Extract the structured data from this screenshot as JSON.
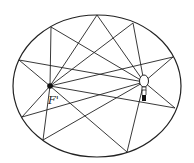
{
  "diagram": {
    "title": "",
    "type": "ellipse-reflection",
    "labels": {
      "focus": "F'"
    },
    "colors": {
      "stroke": "#222222",
      "background": "#ffffff"
    },
    "ellipse": {
      "cx": 97,
      "cy": 86,
      "rx": 84,
      "ry": 71
    },
    "focus_point": {
      "x": 50,
      "y": 86
    },
    "bulb_point": {
      "x": 144,
      "y": 82
    },
    "reflection_points": [
      {
        "x": 97,
        "y": 15
      },
      {
        "x": 51,
        "y": 27
      },
      {
        "x": 133,
        "y": 23
      },
      {
        "x": 19,
        "y": 60
      },
      {
        "x": 173,
        "y": 57
      },
      {
        "x": 22,
        "y": 117
      },
      {
        "x": 175,
        "y": 108
      },
      {
        "x": 43,
        "y": 140
      },
      {
        "x": 127,
        "y": 152
      }
    ],
    "icons": [
      "lightbulb-icon",
      "focus-dot-icon"
    ]
  }
}
